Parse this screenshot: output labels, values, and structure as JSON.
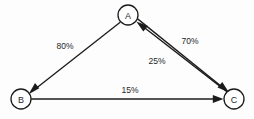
{
  "figure": {
    "type": "directed-graph-diagram",
    "background_color": "#fdfdfd",
    "line_color": "#1b1b1b",
    "text_color": "#262626"
  },
  "nodes": [
    {
      "id": "A",
      "label": "A",
      "cx": 128,
      "cy": 15,
      "r": 10
    },
    {
      "id": "B",
      "label": "B",
      "cx": 21,
      "cy": 99,
      "r": 10
    },
    {
      "id": "C",
      "label": "C",
      "cx": 234,
      "cy": 99,
      "r": 10
    }
  ],
  "edges": [
    {
      "id": "a-to-b",
      "from": "A",
      "to": "B",
      "label": "80%",
      "label_x": 65,
      "label_y": 46,
      "directed": true
    },
    {
      "id": "a-to-c",
      "from": "A",
      "to": "C",
      "label": "70%",
      "label_x": 190,
      "label_y": 41,
      "directed": true
    },
    {
      "id": "c-to-a",
      "from": "C",
      "to": "A",
      "label": "25%",
      "label_x": 157,
      "label_y": 61,
      "directed": true
    },
    {
      "id": "b-to-c",
      "from": "B",
      "to": "C",
      "label": "15%",
      "label_x": 130,
      "label_y": 90,
      "directed": true
    }
  ]
}
